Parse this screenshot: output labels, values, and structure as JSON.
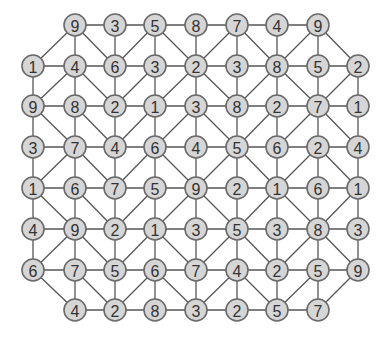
{
  "diagram": {
    "type": "number-grid-graph",
    "columns_x": [
      33,
      75,
      115,
      155,
      196,
      237,
      277,
      318,
      358
    ],
    "rows_y": [
      25,
      66,
      106,
      147,
      188,
      229,
      270,
      310
    ],
    "node_radius": 11,
    "colors": {
      "node_fill": "#d6d6d6",
      "node_stroke": "#6a6a6a",
      "edge": "#555555",
      "text": "#333333"
    },
    "grid": [
      [
        null,
        9,
        3,
        5,
        8,
        7,
        4,
        9,
        null
      ],
      [
        1,
        4,
        6,
        3,
        2,
        3,
        8,
        5,
        2
      ],
      [
        9,
        8,
        2,
        1,
        3,
        8,
        2,
        7,
        1
      ],
      [
        3,
        7,
        4,
        6,
        4,
        5,
        6,
        2,
        4
      ],
      [
        1,
        6,
        7,
        5,
        9,
        2,
        1,
        6,
        1
      ],
      [
        4,
        9,
        2,
        1,
        3,
        5,
        3,
        8,
        3
      ],
      [
        6,
        7,
        5,
        6,
        7,
        4,
        2,
        5,
        9
      ],
      [
        null,
        4,
        2,
        8,
        3,
        2,
        5,
        7,
        null
      ]
    ],
    "diagonals": [
      [
        [
          0,
          1
        ],
        [
          1,
          0
        ]
      ],
      [
        [
          0,
          1
        ],
        [
          1,
          2
        ]
      ],
      [
        [
          0,
          3
        ],
        [
          1,
          2
        ]
      ],
      [
        [
          0,
          3
        ],
        [
          1,
          4
        ]
      ],
      [
        [
          0,
          5
        ],
        [
          1,
          4
        ]
      ],
      [
        [
          0,
          5
        ],
        [
          1,
          6
        ]
      ],
      [
        [
          0,
          7
        ],
        [
          1,
          6
        ]
      ],
      [
        [
          0,
          7
        ],
        [
          1,
          8
        ]
      ],
      [
        [
          1,
          1
        ],
        [
          2,
          0
        ]
      ],
      [
        [
          1,
          1
        ],
        [
          2,
          2
        ]
      ],
      [
        [
          1,
          3
        ],
        [
          2,
          2
        ]
      ],
      [
        [
          1,
          4
        ],
        [
          2,
          3
        ]
      ],
      [
        [
          1,
          4
        ],
        [
          2,
          5
        ]
      ],
      [
        [
          1,
          6
        ],
        [
          2,
          5
        ]
      ],
      [
        [
          1,
          6
        ],
        [
          2,
          7
        ]
      ],
      [
        [
          1,
          8
        ],
        [
          2,
          7
        ]
      ],
      [
        [
          2,
          0
        ],
        [
          3,
          1
        ]
      ],
      [
        [
          2,
          1
        ],
        [
          3,
          2
        ]
      ],
      [
        [
          2,
          3
        ],
        [
          3,
          2
        ]
      ],
      [
        [
          2,
          4
        ],
        [
          3,
          3
        ]
      ],
      [
        [
          2,
          4
        ],
        [
          3,
          5
        ]
      ],
      [
        [
          2,
          6
        ],
        [
          3,
          5
        ]
      ],
      [
        [
          2,
          7
        ],
        [
          3,
          6
        ]
      ],
      [
        [
          2,
          7
        ],
        [
          3,
          8
        ]
      ],
      [
        [
          3,
          1
        ],
        [
          4,
          0
        ]
      ],
      [
        [
          3,
          1
        ],
        [
          4,
          2
        ]
      ],
      [
        [
          3,
          3
        ],
        [
          4,
          2
        ]
      ],
      [
        [
          3,
          3
        ],
        [
          4,
          4
        ]
      ],
      [
        [
          3,
          5
        ],
        [
          4,
          4
        ]
      ],
      [
        [
          3,
          5
        ],
        [
          4,
          6
        ]
      ],
      [
        [
          3,
          7
        ],
        [
          4,
          6
        ]
      ],
      [
        [
          3,
          7
        ],
        [
          4,
          8
        ]
      ],
      [
        [
          4,
          0
        ],
        [
          5,
          1
        ]
      ],
      [
        [
          4,
          1
        ],
        [
          5,
          2
        ]
      ],
      [
        [
          4,
          3
        ],
        [
          5,
          2
        ]
      ],
      [
        [
          4,
          4
        ],
        [
          5,
          3
        ]
      ],
      [
        [
          4,
          4
        ],
        [
          5,
          5
        ]
      ],
      [
        [
          4,
          6
        ],
        [
          5,
          5
        ]
      ],
      [
        [
          4,
          6
        ],
        [
          5,
          7
        ]
      ],
      [
        [
          4,
          8
        ],
        [
          5,
          7
        ]
      ],
      [
        [
          5,
          1
        ],
        [
          6,
          0
        ]
      ],
      [
        [
          5,
          1
        ],
        [
          6,
          2
        ]
      ],
      [
        [
          5,
          3
        ],
        [
          6,
          2
        ]
      ],
      [
        [
          5,
          3
        ],
        [
          6,
          4
        ]
      ],
      [
        [
          5,
          5
        ],
        [
          6,
          4
        ]
      ],
      [
        [
          5,
          5
        ],
        [
          6,
          6
        ]
      ],
      [
        [
          5,
          7
        ],
        [
          6,
          6
        ]
      ],
      [
        [
          5,
          7
        ],
        [
          6,
          8
        ]
      ],
      [
        [
          6,
          0
        ],
        [
          7,
          1
        ]
      ],
      [
        [
          6,
          1
        ],
        [
          7,
          2
        ]
      ],
      [
        [
          6,
          3
        ],
        [
          7,
          2
        ]
      ],
      [
        [
          6,
          3
        ],
        [
          7,
          4
        ]
      ],
      [
        [
          6,
          5
        ],
        [
          7,
          4
        ]
      ],
      [
        [
          6,
          5
        ],
        [
          7,
          6
        ]
      ],
      [
        [
          6,
          7
        ],
        [
          7,
          6
        ]
      ],
      [
        [
          6,
          8
        ],
        [
          7,
          7
        ]
      ]
    ]
  }
}
